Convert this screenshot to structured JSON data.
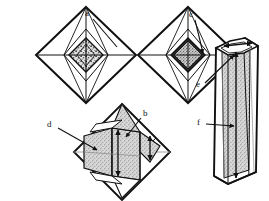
{
  "figure": {
    "kind": "line-art-diagram",
    "background_color": "#ffffff",
    "ink_color": "#111111",
    "fill_stipple_color": "#c9c9c9",
    "fill_dark_color": "#2a2a2a",
    "width": 269,
    "height": 201,
    "panels": [
      {
        "id": "panel-top-left",
        "name": "octahedron-with-core-a",
        "shape": "octahedron",
        "center": [
          86,
          55
        ],
        "half_width": 50,
        "half_height": 48,
        "core": {
          "name": "inner-core-stippled-quadrants",
          "half_width": 17,
          "half_height": 17,
          "style": "four-quadrant-mottled"
        },
        "labels": [
          "a"
        ]
      },
      {
        "id": "panel-top-right",
        "name": "octahedron-with-core-c",
        "shape": "octahedron",
        "center": [
          188,
          55
        ],
        "half_width": 50,
        "half_height": 48,
        "core": {
          "name": "inner-core-dark-stippled",
          "half_width": 17,
          "half_height": 17,
          "style": "dark-rimmed-stipple"
        },
        "labels": [
          "c"
        ]
      },
      {
        "id": "panel-bottom-center",
        "name": "octahedron-with-internal-prism",
        "shape": "octahedron",
        "center": [
          122,
          152
        ],
        "half_width": 48,
        "half_height": 48,
        "core": {
          "name": "internal-prism-stippled",
          "style": "prismatic-block-with-growth-arrows"
        },
        "labels": [
          "d",
          "b"
        ]
      },
      {
        "id": "panel-right",
        "name": "hexagonal-prism",
        "shape": "hexagonal-prism",
        "center": [
          234,
          118
        ],
        "labels": [
          "e",
          "f"
        ]
      }
    ],
    "labels": [
      {
        "id": "a",
        "text": "a",
        "x": 88,
        "y": 14,
        "leader_to": [
          172,
          59
        ],
        "leader_from": [
          86,
          18
        ],
        "arrowhead": false
      },
      {
        "id": "c",
        "text": "c",
        "x": 192,
        "y": 15,
        "leader_to": [
          197,
          60
        ],
        "leader_from": [
          190,
          19
        ],
        "arrowhead": true
      },
      {
        "id": "b",
        "text": "b",
        "x": 143,
        "y": 115,
        "leader_to": [
          125,
          136
        ],
        "leader_from": [
          141,
          119
        ],
        "arrowhead": true
      },
      {
        "id": "d",
        "text": "d",
        "x": 51,
        "y": 126,
        "leader_to": [
          96,
          150
        ],
        "leader_from": [
          57,
          128
        ],
        "arrowhead": true
      },
      {
        "id": "e",
        "text": "e",
        "x": 199,
        "y": 85,
        "leader_to": [
          233,
          54
        ],
        "leader_from": [
          205,
          82
        ],
        "arrowhead": true
      },
      {
        "id": "f",
        "text": "f",
        "x": 199,
        "y": 123,
        "leader_to": [
          233,
          126
        ],
        "leader_from": [
          205,
          124
        ],
        "arrowhead": true
      }
    ],
    "annotations": {
      "growth_arrows": [
        {
          "name": "vertical-growth-arrow-center",
          "double_headed": true
        },
        {
          "name": "vertical-growth-arrow-right",
          "double_headed": true
        },
        {
          "name": "prism-c-axis-arrow",
          "double_headed": true
        },
        {
          "name": "prism-a-axis-arrow",
          "double_headed": true
        }
      ]
    }
  }
}
